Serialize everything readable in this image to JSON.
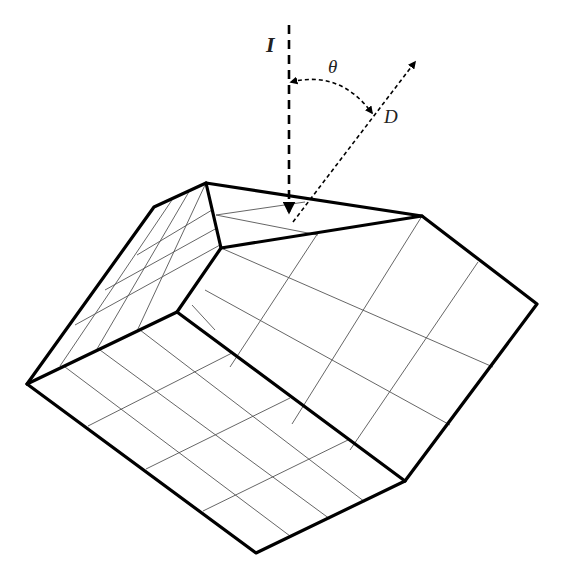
{
  "diagram": {
    "title": "",
    "labels": {
      "incident": "I",
      "angle": "θ",
      "direction": "D"
    },
    "colors": {
      "stroke": "#000000",
      "grid": "#555555",
      "background": "#ffffff"
    }
  }
}
